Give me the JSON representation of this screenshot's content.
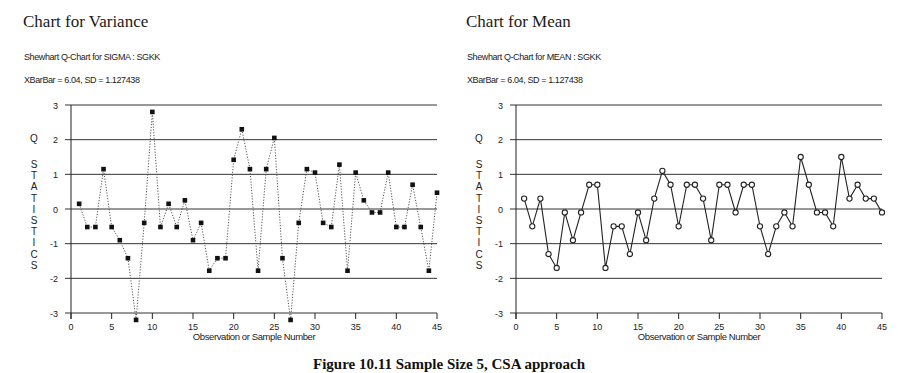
{
  "figure": {
    "caption": "Figure 10.11   Sample Size 5, CSA approach"
  },
  "charts": [
    {
      "panel_title": "Chart for Variance",
      "subtitle": "Shewhart Q-Chart for SIGMA : SGKK",
      "stats_line": "XBarBar = 6.04, SD = 1.127438",
      "ylabel": "Q STATISTICS",
      "xlabel": "Observation or Sample Number",
      "marker": "square",
      "line_style": "dotted"
    },
    {
      "panel_title": "Chart for Mean",
      "subtitle": "Shewhart Q-Chart for MEAN : SGKK",
      "stats_line": "XBarBar = 6.04, SD = 1.127438",
      "ylabel": "Q STATISTICS",
      "xlabel": "Observation or Sample Number",
      "marker": "open-circle",
      "line_style": "solid"
    }
  ],
  "chart_data": [
    {
      "type": "line",
      "title": "Shewhart Q-Chart for SIGMA : SGKK",
      "subtitle": "XBarBar = 6.04, SD = 1.127438",
      "xlabel": "Observation or Sample Number",
      "ylabel": "Q STATISTICS",
      "xlim": [
        0,
        45
      ],
      "ylim": [
        -3,
        3
      ],
      "xticks": [
        0,
        5,
        10,
        15,
        20,
        25,
        30,
        35,
        40,
        45
      ],
      "yticks": [
        -3,
        -2,
        -1,
        0,
        1,
        2,
        3
      ],
      "grid": "horizontal",
      "x": [
        1,
        2,
        3,
        4,
        5,
        6,
        7,
        8,
        9,
        10,
        11,
        12,
        13,
        14,
        15,
        16,
        17,
        18,
        19,
        20,
        21,
        22,
        23,
        24,
        25,
        26,
        27,
        28,
        29,
        30,
        31,
        32,
        33,
        34,
        35,
        36,
        37,
        38,
        39,
        40,
        41,
        42,
        43,
        44,
        45
      ],
      "series": [
        {
          "name": "Q statistic (variance)",
          "values": [
            0.15,
            -0.52,
            -0.52,
            1.15,
            -0.52,
            -0.9,
            -1.42,
            -3.2,
            -0.4,
            2.8,
            -0.52,
            0.15,
            -0.52,
            0.25,
            -0.9,
            -0.4,
            -1.78,
            -1.42,
            -1.42,
            1.42,
            2.3,
            1.15,
            -1.78,
            1.15,
            2.05,
            -1.42,
            -3.2,
            -0.4,
            1.15,
            1.05,
            -0.4,
            -0.52,
            1.28,
            -1.78,
            1.05,
            0.25,
            -0.1,
            -0.1,
            1.05,
            -0.52,
            -0.52,
            0.7,
            -0.52,
            -1.78,
            0.47
          ]
        }
      ]
    },
    {
      "type": "line",
      "title": "Shewhart Q-Chart for MEAN : SGKK",
      "subtitle": "XBarBar = 6.04, SD = 1.127438",
      "xlabel": "Observation or Sample Number",
      "ylabel": "Q STATISTICS",
      "xlim": [
        0,
        45
      ],
      "ylim": [
        -3,
        3
      ],
      "xticks": [
        0,
        5,
        10,
        15,
        20,
        25,
        30,
        35,
        40,
        45
      ],
      "yticks": [
        -3,
        -2,
        -1,
        0,
        1,
        2,
        3
      ],
      "grid": "horizontal",
      "x": [
        1,
        2,
        3,
        4,
        5,
        6,
        7,
        8,
        9,
        10,
        11,
        12,
        13,
        14,
        15,
        16,
        17,
        18,
        19,
        20,
        21,
        22,
        23,
        24,
        25,
        26,
        27,
        28,
        29,
        30,
        31,
        32,
        33,
        34,
        35,
        36,
        37,
        38,
        39,
        40,
        41,
        42,
        43,
        44,
        45
      ],
      "series": [
        {
          "name": "Q statistic (mean)",
          "values": [
            0.3,
            -0.5,
            0.3,
            -1.3,
            -1.7,
            -0.1,
            -0.9,
            -0.1,
            0.7,
            0.7,
            -1.7,
            -0.5,
            -0.5,
            -1.3,
            -0.1,
            -0.9,
            0.3,
            1.1,
            0.7,
            -0.5,
            0.7,
            0.7,
            0.3,
            -0.9,
            0.7,
            0.7,
            -0.1,
            0.7,
            0.7,
            -0.5,
            -1.3,
            -0.5,
            -0.1,
            -0.5,
            1.5,
            0.7,
            -0.1,
            -0.1,
            -0.5,
            1.5,
            0.3,
            0.7,
            0.3,
            0.3,
            -0.1
          ]
        }
      ]
    }
  ]
}
